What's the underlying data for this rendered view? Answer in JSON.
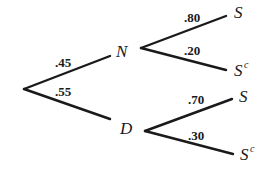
{
  "diagram": {
    "type": "probability-tree",
    "root": {
      "branches": [
        {
          "node": "N",
          "probability": ".45",
          "children": [
            {
              "label": "S",
              "superscript": "",
              "probability": ".80"
            },
            {
              "label": "S",
              "superscript": "c",
              "probability": ".20"
            }
          ]
        },
        {
          "node": "D",
          "probability": ".55",
          "children": [
            {
              "label": "S",
              "superscript": "",
              "probability": ".70"
            },
            {
              "label": "S",
              "superscript": "c",
              "probability": ".30"
            }
          ]
        }
      ]
    }
  }
}
